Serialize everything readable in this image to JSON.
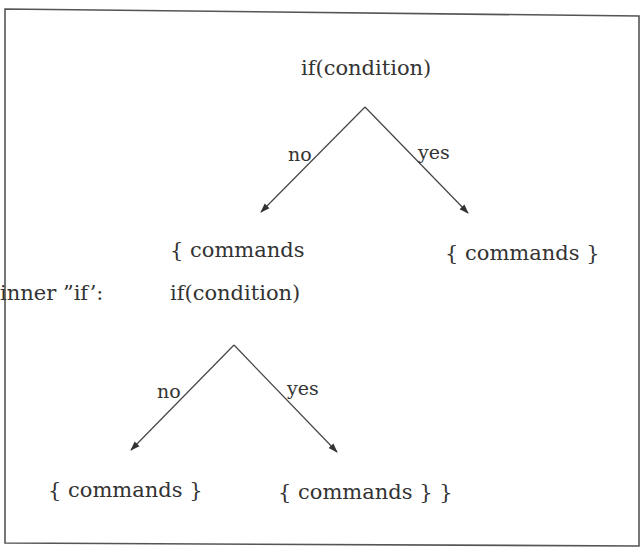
{
  "diagram": {
    "type": "nested-if-flowchart",
    "outer_if": {
      "condition_label": "if(condition)",
      "no_label": "no",
      "yes_label": "yes",
      "no_branch_label": "{ commands",
      "yes_branch_label": "{ commands }"
    },
    "inner_if": {
      "caption": "inner ”if’:",
      "condition_label": "if(condition)",
      "no_label": "no",
      "yes_label": "yes",
      "no_branch_label": "{ commands }",
      "yes_branch_label": "{ commands } }"
    },
    "colors": {
      "line": "#444444",
      "text": "#333333",
      "frame": "#555555",
      "background": "#ffffff"
    }
  }
}
